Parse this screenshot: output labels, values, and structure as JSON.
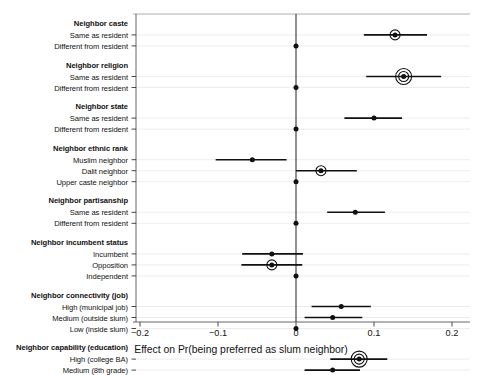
{
  "chart_data": {
    "type": "scatter",
    "subtype": "coefficient-plot-with-error-bars",
    "title": "",
    "xlabel": "Effect on Pr(being preferred as slum neighbor)",
    "ylabel": "",
    "xlim": [
      -0.22,
      0.22
    ],
    "xticks": [
      -0.2,
      -0.1,
      0,
      0.1,
      0.2
    ],
    "xticklabels": [
      "-0.2",
      "-0.1",
      "0",
      "0.1",
      "0.2"
    ],
    "grid": true,
    "gridcolor": "#e8e8e8",
    "reference_line": 0,
    "point_color": "#000000",
    "line_color": "#000000",
    "groups": [
      {
        "name": "Neighbor caste",
        "rows": [
          {
            "label": "Same as resident",
            "estimate": 0.127,
            "ci_low": 0.087,
            "ci_high": 0.168,
            "halo": 1
          },
          {
            "label": "Different from resident",
            "estimate": 0.0,
            "ci_low": 0.0,
            "ci_high": 0.0,
            "halo": 0,
            "baseline": true
          }
        ]
      },
      {
        "name": "Neighbor religion",
        "rows": [
          {
            "label": "Same as resident",
            "estimate": 0.138,
            "ci_low": 0.09,
            "ci_high": 0.186,
            "halo": 2
          },
          {
            "label": "Different from resident",
            "estimate": 0.0,
            "ci_low": 0.0,
            "ci_high": 0.0,
            "halo": 0,
            "baseline": true
          }
        ]
      },
      {
        "name": "Neighbor state",
        "rows": [
          {
            "label": "Same as resident",
            "estimate": 0.1,
            "ci_low": 0.062,
            "ci_high": 0.136,
            "halo": 0
          },
          {
            "label": "Different from resident",
            "estimate": 0.0,
            "ci_low": 0.0,
            "ci_high": 0.0,
            "halo": 0,
            "baseline": true
          }
        ]
      },
      {
        "name": "Neighbor ethnic rank",
        "rows": [
          {
            "label": "Muslim neighbor",
            "estimate": -0.056,
            "ci_low": -0.103,
            "ci_high": -0.012,
            "halo": 0
          },
          {
            "label": "Dalit neighbor",
            "estimate": 0.032,
            "ci_low": 0.0,
            "ci_high": 0.078,
            "halo": 1
          },
          {
            "label": "Upper caste neighbor",
            "estimate": 0.0,
            "ci_low": 0.0,
            "ci_high": 0.0,
            "halo": 0,
            "baseline": true
          }
        ]
      },
      {
        "name": "Neighbor partisanship",
        "rows": [
          {
            "label": "Same as resident",
            "estimate": 0.076,
            "ci_low": 0.04,
            "ci_high": 0.114,
            "halo": 0
          },
          {
            "label": "Different from resident",
            "estimate": 0.0,
            "ci_low": 0.0,
            "ci_high": 0.0,
            "halo": 0,
            "baseline": true
          }
        ]
      },
      {
        "name": "Neighbor incumbent status",
        "rows": [
          {
            "label": "Incumbent",
            "estimate": -0.031,
            "ci_low": -0.069,
            "ci_high": 0.009,
            "halo": 0
          },
          {
            "label": "Opposition",
            "estimate": -0.031,
            "ci_low": -0.07,
            "ci_high": 0.008,
            "halo": 1
          },
          {
            "label": "Independent",
            "estimate": 0.0,
            "ci_low": 0.0,
            "ci_high": 0.0,
            "halo": 0,
            "baseline": true
          }
        ]
      },
      {
        "name": "Neighbor connectivity (job)",
        "rows": [
          {
            "label": "High (municipal job)",
            "estimate": 0.058,
            "ci_low": 0.02,
            "ci_high": 0.096,
            "halo": 0
          },
          {
            "label": "Medium (outside slum)",
            "estimate": 0.047,
            "ci_low": 0.011,
            "ci_high": 0.085,
            "halo": 0
          },
          {
            "label": "Low (inside slum)",
            "estimate": 0.0,
            "ci_low": 0.0,
            "ci_high": 0.0,
            "halo": 0,
            "baseline": true
          }
        ]
      },
      {
        "name": "Neighbor capability (education)",
        "rows": [
          {
            "label": "High (college BA)",
            "estimate": 0.081,
            "ci_low": 0.044,
            "ci_high": 0.117,
            "halo": 2
          },
          {
            "label": "Medium (8th grade)",
            "estimate": 0.047,
            "ci_low": 0.011,
            "ci_high": 0.082,
            "halo": 0
          },
          {
            "label": "Low (none)",
            "estimate": 0.0,
            "ci_low": 0.0,
            "ci_high": 0.0,
            "halo": 0,
            "baseline": true
          }
        ]
      }
    ]
  }
}
